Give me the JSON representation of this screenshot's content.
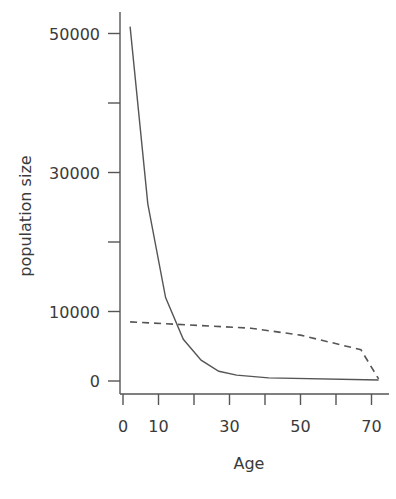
{
  "chart_data": {
    "type": "line",
    "title": "",
    "xlabel": "Age",
    "ylabel": "population size",
    "xlim": [
      0,
      72
    ],
    "ylim": [
      0,
      52000
    ],
    "grid": false,
    "legend": null,
    "x_ticks": [
      0,
      10,
      20,
      30,
      40,
      50,
      60,
      70
    ],
    "x_tick_labels": [
      "0",
      "10",
      "",
      "30",
      "",
      "50",
      "",
      "70"
    ],
    "y_ticks": [
      0,
      10000,
      20000,
      30000,
      40000,
      50000
    ],
    "y_tick_labels": [
      "0",
      "10000",
      "",
      "30000",
      "",
      "50000"
    ],
    "series": [
      {
        "name": "solid",
        "style": "solid",
        "x": [
          2,
          7,
          12,
          17,
          22,
          27,
          32,
          41,
          72
        ],
        "values": [
          51000,
          25500,
          12000,
          6000,
          3000,
          1400,
          850,
          450,
          150
        ]
      },
      {
        "name": "dashed",
        "style": "dashed",
        "x": [
          2,
          36,
          50,
          67,
          72
        ],
        "values": [
          8500,
          7600,
          6600,
          4500,
          300
        ]
      }
    ]
  }
}
